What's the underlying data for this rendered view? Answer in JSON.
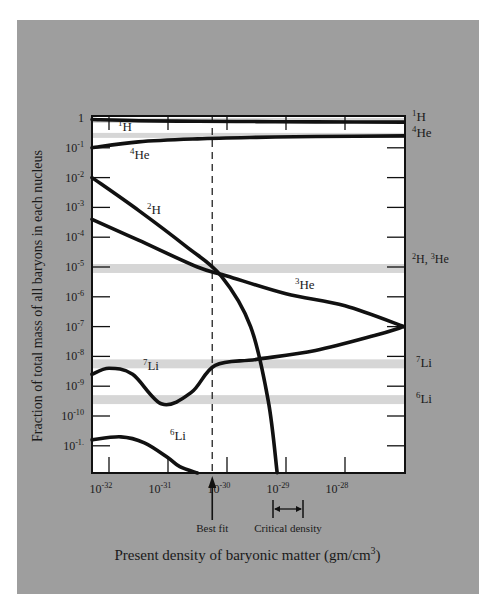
{
  "chart_data": {
    "type": "line",
    "title": "",
    "xlabel": "Present density of baryonic matter (gm/cm3)",
    "xlabel_parts": {
      "text": "Present density of baryonic matter (gm/cm",
      "sup": "3",
      "close": ")"
    },
    "ylabel": "Fraction of total mass of all baryons in each nucleus",
    "x_scale": "log",
    "y_scale": "log",
    "xlim": [
      "10^-32.3",
      "10^-27.0"
    ],
    "ylim": [
      "10^-11.9",
      "1"
    ],
    "x_ticks": [
      {
        "base": "10",
        "exp": "-32",
        "value": 1e-32
      },
      {
        "base": "10",
        "exp": "-31",
        "value": 1e-31
      },
      {
        "base": "10",
        "exp": "-30",
        "value": 1e-30
      },
      {
        "base": "10",
        "exp": "-29",
        "value": 1e-29
      },
      {
        "base": "10",
        "exp": "-28",
        "value": 1e-28
      }
    ],
    "y_ticks": [
      {
        "base": "1",
        "exp": "",
        "value": 1
      },
      {
        "base": "10",
        "exp": "-1",
        "value": 0.1
      },
      {
        "base": "10",
        "exp": "-2",
        "value": 0.01
      },
      {
        "base": "10",
        "exp": "-3",
        "value": 0.001
      },
      {
        "base": "10",
        "exp": "-4",
        "value": 0.0001
      },
      {
        "base": "10",
        "exp": "-5",
        "value": 1e-05
      },
      {
        "base": "10",
        "exp": "-6",
        "value": 1e-06
      },
      {
        "base": "10",
        "exp": "-7",
        "value": 1e-07
      },
      {
        "base": "10",
        "exp": "-8",
        "value": 1e-08
      },
      {
        "base": "10",
        "exp": "-9",
        "value": 1e-09
      },
      {
        "base": "10",
        "exp": "-10",
        "value": 1e-10
      },
      {
        "base": "10",
        "exp": "-1.",
        "value": 1e-11
      }
    ],
    "series": [
      {
        "name": "1H",
        "label_mass": "1",
        "label_el": "H",
        "x_log": [
          -32.3,
          -31.5,
          -30.5,
          -29.5,
          -28.5,
          -27.0
        ],
        "y_log": [
          -0.05,
          -0.09,
          -0.11,
          -0.12,
          -0.13,
          -0.14
        ]
      },
      {
        "name": "4He",
        "label_mass": "4",
        "label_el": "He",
        "x_log": [
          -32.3,
          -31.5,
          -30.5,
          -29.5,
          -28.5,
          -27.0
        ],
        "y_log": [
          -1.0,
          -0.8,
          -0.7,
          -0.65,
          -0.62,
          -0.6
        ]
      },
      {
        "name": "2H",
        "label_mass": "2",
        "label_el": "H",
        "x_log": [
          -32.3,
          -31.5,
          -30.7,
          -30.1,
          -29.6,
          -29.3,
          -29.15
        ],
        "y_log": [
          -2.0,
          -3.1,
          -4.3,
          -5.3,
          -7.0,
          -9.5,
          -11.9
        ]
      },
      {
        "name": "3He",
        "label_mass": "3",
        "label_el": "He",
        "x_log": [
          -32.3,
          -31.5,
          -30.5,
          -30.0,
          -29.0,
          -28.0,
          -27.0
        ],
        "y_log": [
          -3.4,
          -4.1,
          -5.0,
          -5.3,
          -5.9,
          -6.3,
          -7.0
        ]
      },
      {
        "name": "7Li",
        "label_mass": "7",
        "label_el": "Li",
        "x_log": [
          -32.3,
          -32.0,
          -31.6,
          -31.1,
          -30.6,
          -30.2,
          -29.5,
          -28.5,
          -27.5,
          -27.0
        ],
        "y_log": [
          -8.6,
          -8.4,
          -8.6,
          -9.6,
          -9.2,
          -8.3,
          -8.1,
          -7.8,
          -7.3,
          -7.0
        ]
      },
      {
        "name": "6Li",
        "label_mass": "6",
        "label_el": "Li",
        "x_log": [
          -32.3,
          -31.8,
          -31.4,
          -31.0,
          -30.8,
          -30.5
        ],
        "y_log": [
          -10.8,
          -10.7,
          -10.9,
          -11.4,
          -11.7,
          -12.0
        ]
      }
    ],
    "observed_bands": [
      {
        "name": "1H",
        "label_mass": "1",
        "label_el": "H",
        "y_log_range": [
          -0.07,
          0.0
        ]
      },
      {
        "name": "4He",
        "label_mass": "4",
        "label_el": "He",
        "y_log_range": [
          -0.6,
          -0.5
        ]
      },
      {
        "name": "2H, 3He",
        "label_mass": "2",
        "label_el": "H, ",
        "label_mass2": "3",
        "label_el2": "He",
        "y_log_range": [
          -5.2,
          -4.9
        ]
      },
      {
        "name": "7Li",
        "label_mass": "7",
        "label_el": "Li",
        "y_log_range": [
          -8.4,
          -8.1
        ]
      },
      {
        "name": "6Li",
        "label_mass": "6",
        "label_el": "Li",
        "y_log_range": [
          -9.6,
          -9.3
        ]
      }
    ],
    "annotations": [
      {
        "text": "Best fit",
        "type": "dashed-vertical-line-with-arrow",
        "x_log": -30.25
      },
      {
        "text": "Critical density",
        "type": "double-arrow-range",
        "x_log_range": [
          -29.15,
          -28.7
        ]
      }
    ],
    "grid": false,
    "legend": "inline labels"
  },
  "labels": {
    "best_fit": "Best fit",
    "critical_density": "Critical density",
    "ylabel": "Fraction of total mass of all baryons in each nucleus",
    "xlabel_text": "Present density of baryonic matter (gm/cm",
    "xlabel_sup": "3",
    "xlabel_close": ")"
  },
  "colors": {
    "panel": "#9e9e9e",
    "plot_bg": "#ffffff",
    "band": "#d6d6d6",
    "ink": "#111111",
    "text": "#1a1a1a"
  }
}
